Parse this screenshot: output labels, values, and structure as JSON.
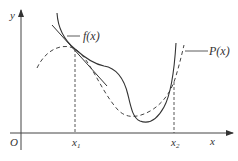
{
  "figure": {
    "axes": {
      "x_label": "x",
      "y_label": "y",
      "origin_label": "O"
    },
    "ticks": [
      {
        "label": "x",
        "sub": "1"
      },
      {
        "label": "x",
        "sub": "2"
      }
    ],
    "curves": [
      {
        "name": "f(x)",
        "style": "solid"
      },
      {
        "name": "P(x)",
        "style": "dashed"
      }
    ],
    "tangent_line": "tangent to f(x) at x1",
    "colors": {
      "stroke": "#333333",
      "background": "#ffffff"
    }
  }
}
